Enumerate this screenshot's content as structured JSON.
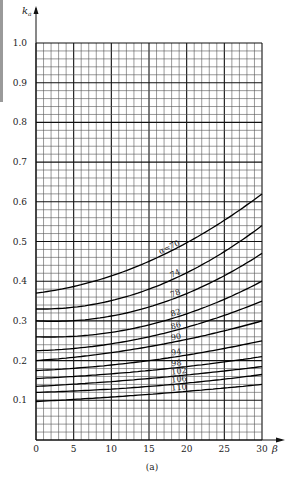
{
  "chart_data": {
    "type": "line",
    "title": "",
    "caption": "(a)",
    "xlabel": "β",
    "ylabel": "k_a",
    "xlim": [
      0,
      30
    ],
    "ylim": [
      0,
      1.0
    ],
    "xticks": [
      0,
      5,
      10,
      15,
      20,
      25,
      30
    ],
    "yticks": [
      0.1,
      0.2,
      0.3,
      0.4,
      0.5,
      0.6,
      0.7,
      0.8,
      0.9,
      1.0
    ],
    "ytick_labels": [
      "0.1",
      "0.2",
      "0.3",
      "0.4",
      "0.5",
      "0.6",
      "0.7",
      "0.8",
      "0.9",
      "1.0"
    ],
    "xtick_labels": [
      "0",
      "5",
      "10",
      "15",
      "20",
      "25",
      "30"
    ],
    "grid": true,
    "grid_minor_x_step": 1,
    "grid_minor_y_step": 0.02,
    "legend": "none (curves labeled inline)",
    "x": [
      0,
      15,
      30
    ],
    "series": [
      {
        "name": "α=70",
        "label": "α=70",
        "values": [
          0.37,
          0.45,
          0.62
        ]
      },
      {
        "name": "α=74",
        "label": "74",
        "values": [
          0.33,
          0.38,
          0.54
        ]
      },
      {
        "name": "α=78",
        "label": "78",
        "values": [
          0.3,
          0.335,
          0.47
        ]
      },
      {
        "name": "α=82",
        "label": "82",
        "values": [
          0.26,
          0.29,
          0.4
        ]
      },
      {
        "name": "α=86",
        "label": "86",
        "values": [
          0.225,
          0.26,
          0.35
        ]
      },
      {
        "name": "α=90",
        "label": "90",
        "values": [
          0.2,
          0.235,
          0.3
        ]
      },
      {
        "name": "α=94",
        "label": "94",
        "values": [
          0.175,
          0.2,
          0.25
        ]
      },
      {
        "name": "α=98",
        "label": "98",
        "values": [
          0.155,
          0.175,
          0.21
        ]
      },
      {
        "name": "α=102",
        "label": "102",
        "values": [
          0.135,
          0.155,
          0.185
        ]
      },
      {
        "name": "α=106",
        "label": "106",
        "values": [
          0.12,
          0.135,
          0.165
        ]
      },
      {
        "name": "α=110",
        "label": "110",
        "values": [
          0.097,
          0.115,
          0.14
        ]
      }
    ]
  }
}
